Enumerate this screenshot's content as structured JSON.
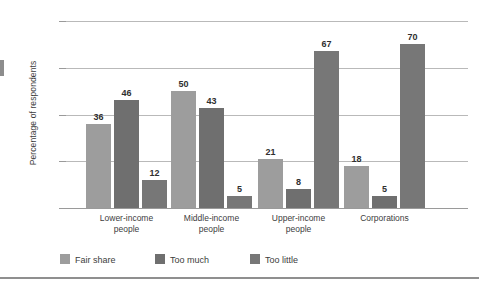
{
  "chart_data": {
    "type": "bar",
    "title": "",
    "xlabel": "",
    "ylabel": "Percentage of respondents",
    "ylim": [
      0,
      80
    ],
    "yticks": [
      0,
      20,
      40,
      60,
      80
    ],
    "ytick_labels": [
      "0",
      "20",
      "40",
      "60",
      "80"
    ],
    "grid": "horizontal",
    "legend_position": "bottom",
    "categories": [
      "Lower-income people",
      "Middle-income people",
      "Upper-income people",
      "Corporations"
    ],
    "category_lines": [
      [
        "Lower-income",
        "people"
      ],
      [
        "Middle-income",
        "people"
      ],
      [
        "Upper-income",
        "people"
      ],
      [
        "Corporations",
        ""
      ]
    ],
    "series": [
      {
        "name": "Fair share",
        "color": "#9d9d9d",
        "values": [
          36,
          50,
          21,
          18
        ]
      },
      {
        "name": "Too much",
        "color": "#6f6f6f",
        "values": [
          46,
          43,
          8,
          5
        ]
      },
      {
        "name": "Too little",
        "color": "#777777",
        "values": [
          12,
          5,
          67,
          70
        ]
      }
    ]
  },
  "legend": {
    "items": [
      {
        "label": "Fair share",
        "swatch": "#9d9d9d"
      },
      {
        "label": "Too much",
        "swatch": "#6f6f6f"
      },
      {
        "label": "Too little",
        "swatch": "#777777"
      }
    ]
  },
  "colors": {
    "gridline": "#b9b9b9",
    "axis": "#9a9a9a",
    "text": "#3d3d3d",
    "value_text": "#2f2f2f",
    "bottom_rule": "#8f8f8f",
    "background": "#ffffff"
  }
}
